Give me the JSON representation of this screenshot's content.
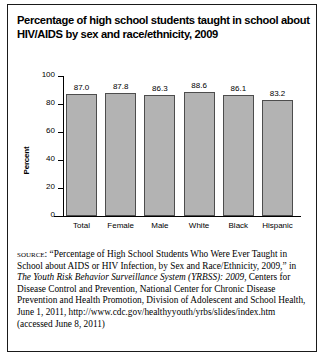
{
  "figure": {
    "title_lines": [
      "Percentage of high school students taught in school about",
      "HIV/AIDS by sex and race/ethnicity, 2009"
    ]
  },
  "chart_data": {
    "type": "bar",
    "title": "Percentage of high school students taught in school about HIV/AIDS by sex and race/ethnicity, 2009",
    "categories": [
      "Total",
      "Female",
      "Male",
      "White",
      "Black",
      "Hispanic"
    ],
    "values": [
      87.0,
      87.8,
      86.3,
      88.6,
      86.1,
      83.2
    ],
    "value_labels": [
      "87.0",
      "87.8",
      "86.3",
      "88.6",
      "86.1",
      "83.2"
    ],
    "xlabel": "",
    "ylabel": "Percent",
    "ylim": [
      0,
      100
    ],
    "yticks": [
      0,
      20,
      40,
      60,
      80,
      100
    ],
    "ytick_labels": [
      "0",
      "20",
      "40",
      "60",
      "80",
      "100"
    ],
    "grid": false,
    "legend": false,
    "bar_color": "#b3b3b3",
    "bar_edge_color": "#4d4d4d"
  },
  "source": {
    "label": "source:",
    "text_1": " “Percentage of High School Students Who Were Ever Taught in School about AIDS or HIV Infection, by Sex and Race/Ethnicity, 2009,” in ",
    "italic_1": "The Youth Risk Behavior Surveillance System (YRBSS): 2009,",
    "text_2": " Centers for Disease Control and Prevention, National Center for Chronic Disease Prevention and Health Promotion, Division of Adolescent and School Health, June 1, 2011, http://www.cdc.gov/healthyyouth/yrbs/slides/index.htm (accessed June 8, 2011)"
  }
}
